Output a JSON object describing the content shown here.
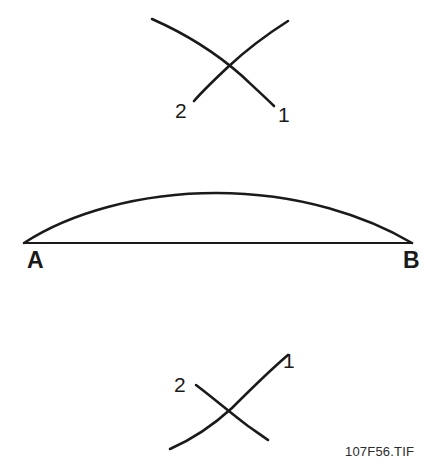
{
  "figure": {
    "caption": "107F56.TIF",
    "background_color": "#ffffff",
    "ink_color": "#1a1a1a"
  },
  "panels": [
    {
      "id": "top-crossing-rays",
      "name": "upper-crossed-curves",
      "labels": [
        {
          "text": "2",
          "x": 175,
          "y": 118
        },
        {
          "text": "1",
          "x": 278,
          "y": 122
        }
      ],
      "curves": [
        {
          "name": "curve-2-upper",
          "path": "M152,19 C186,34 216,53 241,75 C255,88 266,98 274,106",
          "width": 2.6
        },
        {
          "name": "curve-1-upper",
          "path": "M288,21 C266,35 245,51 228,67 C212,82 201,93 194,101",
          "width": 2.6
        }
      ]
    },
    {
      "id": "middle-lens",
      "name": "arc-over-chord",
      "labels": [
        {
          "text": "A",
          "x": 27,
          "y": 268
        },
        {
          "text": "B",
          "x": 403,
          "y": 268
        }
      ],
      "curves": [
        {
          "name": "chord-line-ab",
          "path": "M24,243 L412,243",
          "width": 2.2
        },
        {
          "name": "arc-bulge",
          "path": "M24,243 C70,213 140,193 216,193 C300,193 368,217 412,243",
          "width": 2.6
        }
      ]
    },
    {
      "id": "bottom-crossing-rays",
      "name": "lower-crossed-curves",
      "labels": [
        {
          "text": "2",
          "x": 174,
          "y": 392
        },
        {
          "text": "1",
          "x": 283,
          "y": 368
        }
      ],
      "curves": [
        {
          "name": "curve-1-lower",
          "path": "M288,355 C268,372 248,392 232,408 C208,430 186,442 170,449",
          "width": 2.6
        },
        {
          "name": "curve-2-lower",
          "path": "M196,385 C212,397 232,414 248,426 C258,433 264,437 268,440",
          "width": 2.6
        }
      ]
    }
  ]
}
